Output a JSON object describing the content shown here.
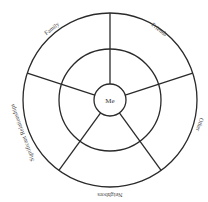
{
  "diagram": {
    "type": "social-circle-wheel",
    "center_label": "Me",
    "sectors": [
      {
        "label": "Friends"
      },
      {
        "label": "Other"
      },
      {
        "label": "Neighbors"
      },
      {
        "label": "Significant Relationships"
      },
      {
        "label": "Family"
      }
    ],
    "colors": {
      "stroke": "#2a2a2a",
      "text": "#444444",
      "background": "#ffffff"
    }
  }
}
